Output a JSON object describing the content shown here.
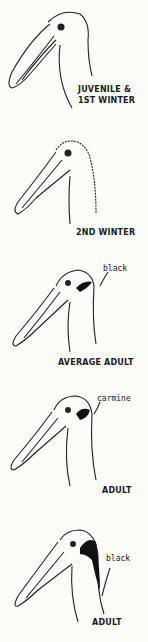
{
  "figure": {
    "panels": [
      {
        "label_line1": "JUVENILE &",
        "label_line2": "1ST WINTER",
        "annotation": null
      },
      {
        "label": "2ND WINTER",
        "annotation": null
      },
      {
        "label": "AVERAGE ADULT",
        "annotation": "black"
      },
      {
        "label": "ADULT",
        "annotation": "carmine"
      },
      {
        "label": "ADULT",
        "annotation": "black"
      }
    ]
  }
}
